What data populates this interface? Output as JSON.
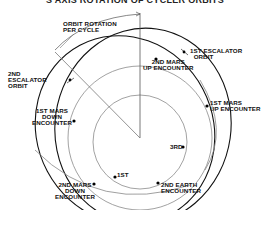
{
  "title": "S AXIS ROTATION OF CYCLER ORBITS",
  "labels": {
    "orbit_rotation": "ORBIT ROTATION\nPER CYCLE",
    "first_escalator_orbit": "1ST ESCALATOR\n  ORBIT",
    "second_escalator_orbit": "2ND\nESCALATOR\nORBIT",
    "second_mars_up": "2ND MARS\nUP ENCOUNTER",
    "first_mars_up": "1ST MARS\nUP ENCOUNTER",
    "first_mars_down": "1ST MARS\nDOWN\nENCOUNTER",
    "third": "3RD",
    "first": "1ST",
    "second_earth": "2ND EARTH\nENCOUNTER",
    "second_mars_down": "2ND MARS\nDOWN\nENCOUNTER"
  },
  "colors": {
    "orbit_dark": "#111111",
    "orbit_light": "#888888",
    "line": "#555555"
  }
}
